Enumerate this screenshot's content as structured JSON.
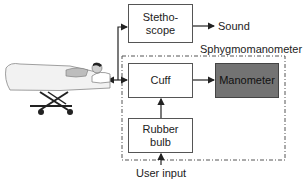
{
  "diagram": {
    "title": "Sphygmomanometer",
    "nodes": [
      {
        "id": "stethoscope",
        "label": "Stetho-\nscope"
      },
      {
        "id": "cuff",
        "label": "Cuff"
      },
      {
        "id": "manometer",
        "label": "Manometer",
        "fill": "#737373"
      },
      {
        "id": "rubber_bulb",
        "label": "Rubber\nbulb"
      }
    ],
    "labels": {
      "sound": "Sound",
      "group": "Sphygmomanometer",
      "user_input": "User input"
    },
    "patient": {
      "icon": "patient-on-stretcher-icon"
    },
    "edges": [
      {
        "from": "patient",
        "to": "stethoscope"
      },
      {
        "from": "patient",
        "to": "cuff",
        "bidirectional": true
      },
      {
        "from": "stethoscope",
        "to": "sound"
      },
      {
        "from": "cuff",
        "to": "manometer"
      },
      {
        "from": "rubber_bulb",
        "to": "cuff"
      },
      {
        "from": "user_input",
        "to": "rubber_bulb"
      }
    ],
    "colors": {
      "line": "#333333",
      "box_border": "#555555",
      "manometer_fill": "#737373"
    }
  }
}
